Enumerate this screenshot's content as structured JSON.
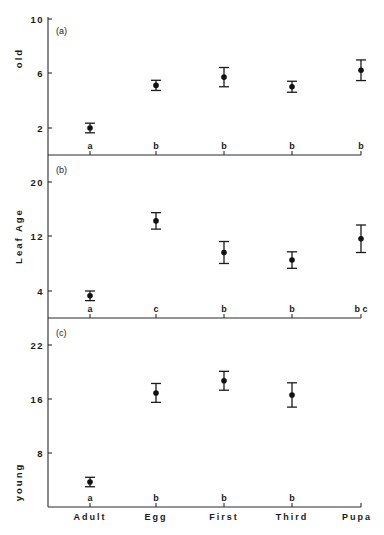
{
  "chart_data": {
    "type": "scatter",
    "style": "point estimates with error bars, three vertically stacked panels sharing x axis",
    "categories": [
      "Adult",
      "Egg",
      "First",
      "Third",
      "Pupa"
    ],
    "ylabel_shared": "Leaf Age",
    "panels": [
      {
        "id": "a",
        "panel_label": "(a)",
        "axis_title": "old",
        "yticks": [
          2,
          6,
          10
        ],
        "ylim": [
          0,
          10
        ],
        "values": [
          2.0,
          5.1,
          5.7,
          5.0,
          6.2
        ],
        "errors": [
          0.35,
          0.37,
          0.7,
          0.4,
          0.75
        ],
        "significance": [
          "a",
          "b",
          "b",
          "b",
          "b"
        ]
      },
      {
        "id": "b",
        "panel_label": "(b)",
        "axis_title": "Leaf Age",
        "yticks": [
          4,
          12,
          20
        ],
        "ylim": [
          0,
          22
        ],
        "values": [
          3.3,
          14.2,
          9.6,
          8.5,
          11.6
        ],
        "errors": [
          0.7,
          1.2,
          1.6,
          1.2,
          2.0
        ],
        "significance": [
          "a",
          "c",
          "b",
          "b",
          "b c"
        ]
      },
      {
        "id": "c",
        "panel_label": "(c)",
        "axis_title": "young",
        "yticks": [
          8,
          16,
          22
        ],
        "ytick_positions_note": "tick labeled 22 sits one interval above 16",
        "ylim": [
          0,
          26
        ],
        "values": [
          3.7,
          16.9,
          18.7,
          16.6,
          null
        ],
        "errors": [
          0.7,
          1.4,
          1.4,
          1.8,
          null
        ],
        "significance": [
          "a",
          "b",
          "b",
          "b",
          ""
        ]
      }
    ],
    "grid": false,
    "legend": null
  }
}
